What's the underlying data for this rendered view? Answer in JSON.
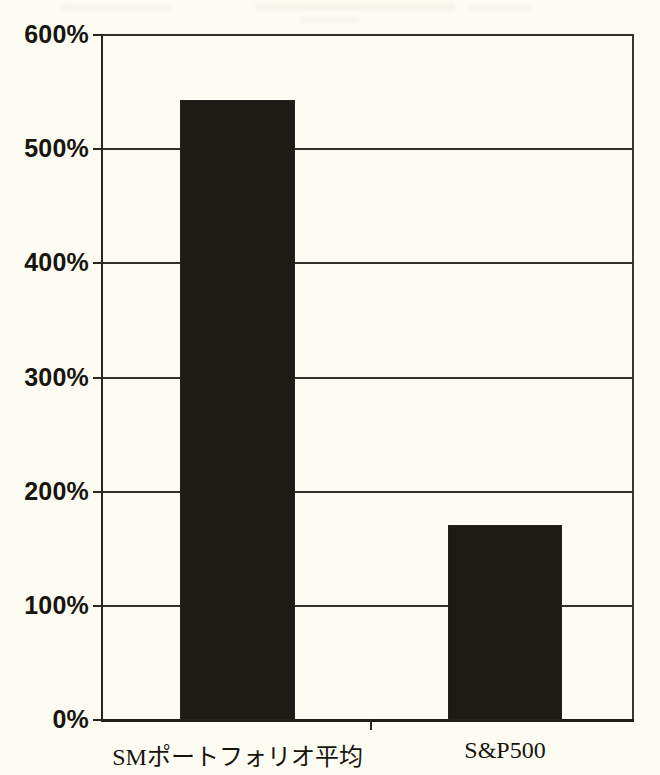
{
  "chart_data": {
    "type": "bar",
    "title": "",
    "subtitle": "",
    "xlabel": "",
    "ylabel": "",
    "categories": [
      "SMポートフォリオ平均",
      "S&P500"
    ],
    "values": [
      541,
      169
    ],
    "value_unit": "%",
    "ylim": [
      0,
      600
    ],
    "ytick_values": [
      0,
      100,
      200,
      300,
      400,
      500,
      600
    ],
    "ytick_labels": [
      "0%",
      "100%",
      "200%",
      "300%",
      "400%",
      "500%",
      "600%"
    ],
    "grid": true,
    "grid_axis": "y",
    "legend": false,
    "legend_position": "none",
    "series": [
      {
        "name": "",
        "values": [
          541,
          169
        ],
        "color": "#1e1a15"
      }
    ],
    "annotations": [],
    "colors": {
      "bar": "#1e1a15",
      "paper": "#fdfcf3",
      "axis": "#2a261d",
      "grid": "#33302a",
      "text": "#17140e"
    }
  }
}
